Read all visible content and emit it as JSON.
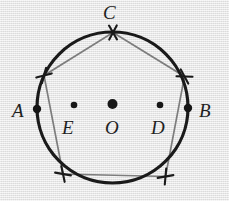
{
  "figure": {
    "background_color": "#e8e8e8",
    "circle_color": "#1a1a1a",
    "pentagon_color": "#7d7d7d",
    "point_color": "#161616",
    "label_color": "#1f1f1f",
    "circle": {
      "cx": 112.5,
      "cy": 107.5,
      "r": 75.5,
      "stroke_width": 3.2
    },
    "labels": [
      {
        "id": "A",
        "text": "A",
        "x": 12,
        "y": 101
      },
      {
        "id": "B",
        "text": "B",
        "x": 199,
        "y": 101
      },
      {
        "id": "C",
        "text": "C",
        "x": 103,
        "y": 3
      },
      {
        "id": "E",
        "text": "E",
        "x": 62,
        "y": 118
      },
      {
        "id": "O",
        "text": "O",
        "x": 105,
        "y": 118
      },
      {
        "id": "D",
        "text": "D",
        "x": 151,
        "y": 118
      }
    ],
    "points": [
      {
        "id": "A",
        "label": "A",
        "cx": 37.0,
        "cy": 109.0,
        "r": 4.2
      },
      {
        "id": "E",
        "label": "E",
        "cx": 74.0,
        "cy": 105.0,
        "r": 3.3
      },
      {
        "id": "O",
        "label": "O",
        "cx": 112.5,
        "cy": 104.0,
        "r": 5.0
      },
      {
        "id": "D",
        "label": "D",
        "cx": 160.0,
        "cy": 105.0,
        "r": 3.3
      },
      {
        "id": "B",
        "label": "B",
        "cx": 188.0,
        "cy": 108.0,
        "r": 4.2
      }
    ],
    "pentagon": {
      "stroke_width": 1.7,
      "vertices": [
        {
          "id": "V1",
          "x": 113.0,
          "y": 32.5
        },
        {
          "id": "V2",
          "x": 184.5,
          "y": 76.5
        },
        {
          "id": "V3",
          "x": 165.5,
          "y": 176.5
        },
        {
          "id": "V4",
          "x": 63.0,
          "y": 174.0
        },
        {
          "id": "V5",
          "x": 44.0,
          "y": 75.5
        }
      ]
    },
    "arc_marks": [
      {
        "id": "mark-C",
        "cx": 113.0,
        "cy": 32.5,
        "a1": 60,
        "a2": 118,
        "len": 16
      },
      {
        "id": "mark-V2",
        "cx": 184.5,
        "cy": 76.5,
        "a1": 2,
        "a2": 62,
        "len": 16
      },
      {
        "id": "mark-V3",
        "cx": 165.5,
        "cy": 176.5,
        "a1": 95,
        "a2": 170,
        "len": 16
      },
      {
        "id": "mark-V4",
        "cx": 63.0,
        "cy": 174.0,
        "a1": 10,
        "a2": 78,
        "len": 16
      },
      {
        "id": "mark-V5",
        "cx": 44.0,
        "cy": 75.5,
        "a1": 105,
        "a2": 165,
        "len": 16
      }
    ]
  }
}
